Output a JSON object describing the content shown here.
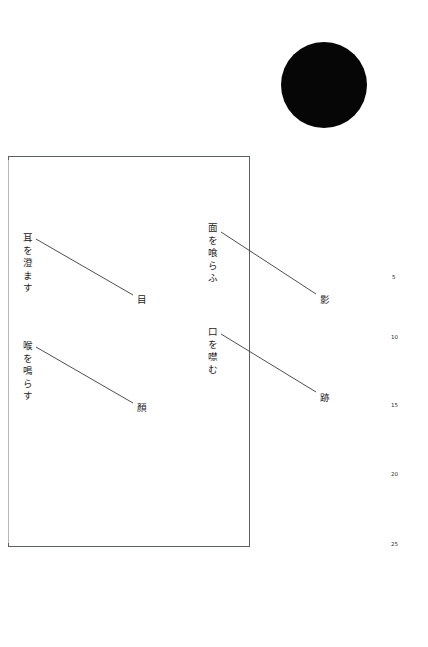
{
  "page": {
    "width": 428,
    "height": 647,
    "background_color": "#ffffff",
    "ink_color": "#1c1c1c"
  },
  "disc": {
    "label": "black-circle",
    "color": "#060606",
    "center_x": 324,
    "center_y": 85,
    "diameter": 86
  },
  "frame": {
    "label": "text-field-border",
    "stroke_color": "#5b5f66",
    "x": 8,
    "y": 156,
    "width": 242,
    "height": 391
  },
  "stanzas": [
    {
      "id": "stanza-1",
      "phrase": "耳を澄ます",
      "reading": "mimi wo sumasu",
      "endpoint_word": "目",
      "phrase_x": 22,
      "phrase_y": 233,
      "end_x": 137,
      "end_y": 292,
      "line": {
        "x1": 36,
        "y1": 239,
        "x2": 133,
        "y2": 295
      }
    },
    {
      "id": "stanza-2",
      "phrase": "喉を鳴らす",
      "reading": "nodo wo narasu",
      "endpoint_word": "顏",
      "phrase_x": 22,
      "phrase_y": 341,
      "end_x": 137,
      "end_y": 400,
      "line": {
        "x1": 36,
        "y1": 347,
        "x2": 133,
        "y2": 403
      }
    },
    {
      "id": "stanza-3",
      "phrase": "面を喰らふ",
      "reading": "men wo kurau",
      "endpoint_word": "影",
      "phrase_x": 207,
      "phrase_y": 223,
      "end_x": 320,
      "end_y": 292,
      "line": {
        "x1": 221,
        "y1": 232,
        "x2": 316,
        "y2": 294
      }
    },
    {
      "id": "stanza-4",
      "phrase": "口を噤む",
      "reading": "kuchi wo tsugumu",
      "endpoint_word": "跡",
      "phrase_x": 207,
      "phrase_y": 327,
      "end_x": 320,
      "end_y": 390,
      "line": {
        "x1": 221,
        "y1": 334,
        "x2": 316,
        "y2": 392
      }
    }
  ],
  "line_numbers": [
    {
      "label": "5",
      "x": 392,
      "y": 274
    },
    {
      "label": "10",
      "x": 391,
      "y": 334
    },
    {
      "label": "15",
      "x": 391,
      "y": 402
    },
    {
      "label": "20",
      "x": 391,
      "y": 471
    },
    {
      "label": "25",
      "x": 391,
      "y": 541
    }
  ]
}
